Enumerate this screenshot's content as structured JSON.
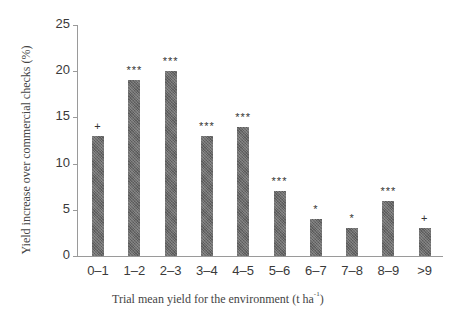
{
  "chart_data": {
    "type": "bar",
    "title": "",
    "xlabel": "Trial mean yield for the environment (t ha-1)",
    "xlabel_main": "Trial mean yield for the environment (t ha",
    "xlabel_sup": "-1",
    "xlabel_close": ")",
    "ylabel": "Yield increase over commercial checks (%)",
    "ylim": [
      0,
      25
    ],
    "yticks": [
      "0",
      "5",
      "10",
      "15",
      "20",
      "25"
    ],
    "categories": [
      "0–1",
      "1–2",
      "2–3",
      "3–4",
      "4–5",
      "5–6",
      "6–7",
      "7–8",
      "8–9",
      ">9"
    ],
    "values": [
      13,
      19,
      20,
      13,
      14,
      7,
      4,
      3,
      6,
      3
    ],
    "significance": [
      "+",
      "***",
      "***",
      "***",
      "***",
      "***",
      "*",
      "*",
      "***",
      "+"
    ],
    "grid": false,
    "legend": null,
    "bar_color": "#6b6b6b"
  }
}
